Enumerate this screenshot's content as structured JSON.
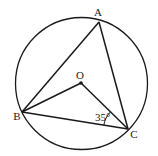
{
  "figure": {
    "type": "circle-geometry",
    "circle": {
      "center": "O"
    },
    "points": {
      "A": {
        "label": "A"
      },
      "B": {
        "label": "B"
      },
      "C": {
        "label": "C"
      },
      "O": {
        "label": "O"
      }
    },
    "segments": [
      "AB",
      "AC",
      "BC",
      "OB",
      "OC"
    ],
    "angle": {
      "vertex": "C",
      "between": [
        "OC",
        "BC"
      ],
      "label": "35°"
    },
    "colors": {
      "stroke": "#1a1a1a",
      "background": "#ffffff"
    }
  }
}
